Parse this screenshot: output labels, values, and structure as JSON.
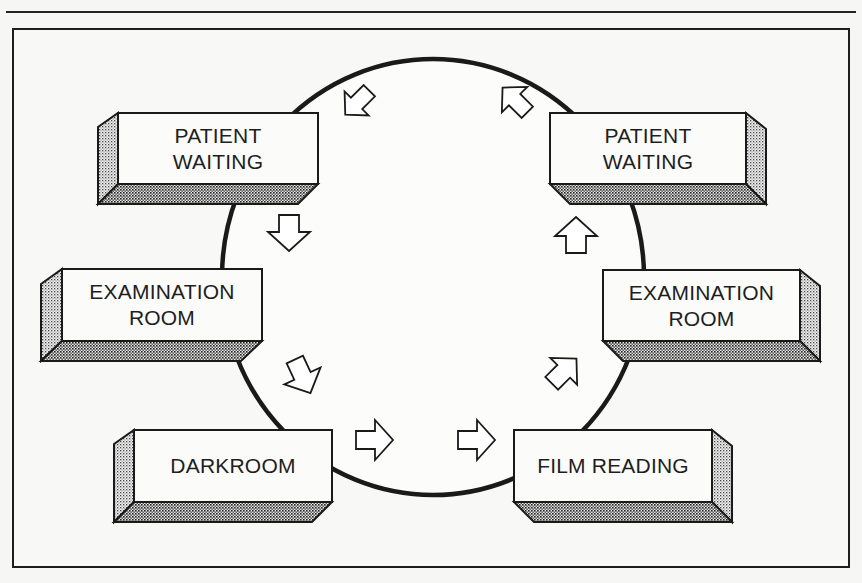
{
  "figure": {
    "caption_visible": false,
    "frame_color": "#1e1e1e",
    "background": "#f8f8f6"
  },
  "cycle": {
    "shape": "circle",
    "center": [
      432,
      277
    ],
    "radius_x": 212,
    "radius_y": 218
  },
  "stations": {
    "left": [
      {
        "id": "left-patient-waiting",
        "label": "PATIENT\nWAITING",
        "order": 1
      },
      {
        "id": "left-examination-room",
        "label": "EXAMINATION\nROOM",
        "order": 2
      },
      {
        "id": "darkroom",
        "label": "DARKROOM",
        "order": 3
      }
    ],
    "right": [
      {
        "id": "film-reading",
        "label": "FILM READING",
        "order": 4
      },
      {
        "id": "right-examination-room",
        "label": "EXAMINATION\nROOM",
        "order": 5
      },
      {
        "id": "right-patient-waiting",
        "label": "PATIENT\nWAITING",
        "order": 6
      }
    ]
  },
  "flow_arrows": [
    {
      "from": "left-patient-waiting-top",
      "to": "left-patient-waiting",
      "direction": "down-left"
    },
    {
      "from": "left-patient-waiting",
      "to": "left-examination-room",
      "direction": "down"
    },
    {
      "from": "left-examination-room",
      "to": "darkroom",
      "direction": "down-right"
    },
    {
      "from": "darkroom",
      "to": "center-bottom",
      "direction": "right"
    },
    {
      "from": "center-bottom",
      "to": "film-reading",
      "direction": "right"
    },
    {
      "from": "film-reading",
      "to": "right-examination-room",
      "direction": "up-right"
    },
    {
      "from": "right-examination-room",
      "to": "right-patient-waiting",
      "direction": "up"
    },
    {
      "from": "right-patient-waiting",
      "to": "top",
      "direction": "up-left"
    }
  ]
}
